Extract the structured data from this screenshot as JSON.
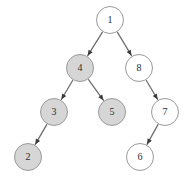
{
  "diagram": {
    "type": "binary-tree",
    "title": "",
    "background_color": "#ffffff",
    "node_fill_highlighted": "#d6d6d6",
    "node_fill_plain": "#ffffff",
    "node_stroke": "#9a9a9a",
    "edge_color": "#6f6f6f",
    "label_color": "#2b2b2b",
    "node_radius": 14,
    "nodes": [
      {
        "id": "n1",
        "label": "1",
        "cx": 110,
        "cy": 20,
        "r": 14,
        "highlighted": false
      },
      {
        "id": "n4",
        "label": "4",
        "cx": 80,
        "cy": 68,
        "r": 14,
        "highlighted": true
      },
      {
        "id": "n8",
        "label": "8",
        "cx": 139,
        "cy": 68,
        "r": 14,
        "highlighted": false
      },
      {
        "id": "n3",
        "label": "3",
        "cx": 54,
        "cy": 112,
        "r": 14,
        "highlighted": true
      },
      {
        "id": "n5",
        "label": "5",
        "cx": 112,
        "cy": 112,
        "r": 14,
        "highlighted": true
      },
      {
        "id": "n7",
        "label": "7",
        "cx": 165,
        "cy": 112,
        "r": 14,
        "highlighted": false
      },
      {
        "id": "n2",
        "label": "2",
        "cx": 28,
        "cy": 157,
        "r": 14,
        "highlighted": true
      },
      {
        "id": "n6",
        "label": "6",
        "cx": 140,
        "cy": 157,
        "r": 14,
        "highlighted": false
      }
    ],
    "edges": [
      {
        "from": "n1",
        "to": "n4",
        "directed": true
      },
      {
        "from": "n1",
        "to": "n8",
        "directed": true
      },
      {
        "from": "n4",
        "to": "n3",
        "directed": true
      },
      {
        "from": "n4",
        "to": "n5",
        "directed": true
      },
      {
        "from": "n3",
        "to": "n2",
        "directed": true
      },
      {
        "from": "n8",
        "to": "n7",
        "directed": true
      },
      {
        "from": "n7",
        "to": "n6",
        "directed": true
      }
    ]
  }
}
